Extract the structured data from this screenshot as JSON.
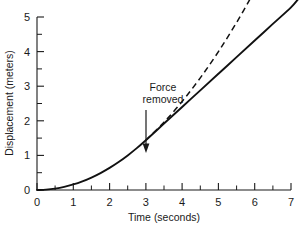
{
  "chart_data": {
    "type": "line",
    "title": "",
    "xlabel": "Time (seconds)",
    "ylabel": "Displacement (meters)",
    "xlim": [
      0,
      7
    ],
    "ylim": [
      0,
      5
    ],
    "xticks": [
      0,
      1,
      2,
      3,
      4,
      5,
      6,
      7
    ],
    "xtick_labels": [
      "0",
      "1",
      "2",
      "3",
      "4",
      "5",
      "6",
      "7"
    ],
    "yticks": [
      0,
      1,
      2,
      3,
      4,
      5
    ],
    "ytick_labels": [
      "0",
      "1",
      "2",
      "3",
      "4",
      "5"
    ],
    "x_minor_ticks": [
      0.5,
      1.5,
      2.5,
      3.5,
      4.5,
      5.5,
      6.5
    ],
    "y_minor_ticks": [
      0.5,
      1.5,
      2.5,
      3.5,
      4.5
    ],
    "grid": false,
    "legend": "none",
    "series": [
      {
        "name": "Displacement with force removed at t = 3 s",
        "style": "solid",
        "color": "#111111",
        "x": [
          0,
          0.25,
          0.5,
          0.75,
          1,
          1.25,
          1.5,
          1.75,
          2,
          2.25,
          2.5,
          2.75,
          3,
          3.5,
          4,
          4.5,
          5,
          5.5,
          6,
          6.5,
          7,
          7.2
        ],
        "y": [
          0,
          0.01,
          0.04,
          0.09,
          0.16,
          0.25,
          0.36,
          0.49,
          0.64,
          0.81,
          1.0,
          1.21,
          1.44,
          1.92,
          2.4,
          2.88,
          3.36,
          3.84,
          4.32,
          4.8,
          5.28,
          5.52
        ]
      },
      {
        "name": "Extrapolated parabola if force continued",
        "style": "dashed",
        "color": "#111111",
        "x": [
          3,
          3.5,
          4,
          4.5,
          5,
          5.5,
          6,
          6.2
        ],
        "y": [
          1.44,
          1.96,
          2.56,
          3.24,
          4.0,
          4.84,
          5.76,
          6.15
        ]
      }
    ],
    "annotations": [
      {
        "text_lines": [
          "Force",
          "removed"
        ],
        "text_x": 2.55,
        "text_y": 3.2,
        "arrow_from_x": 3.0,
        "arrow_from_y": 2.55,
        "arrow_to_x": 3.0,
        "arrow_to_y": 1.55
      }
    ]
  },
  "annotation": {
    "line1": "Force",
    "line2": "removed"
  },
  "axes": {
    "x_title": "Time (seconds)",
    "y_title": "Displacement (meters)",
    "x_labels": [
      "0",
      "1",
      "2",
      "3",
      "4",
      "5",
      "6",
      "7"
    ],
    "y_labels": [
      "0",
      "1",
      "2",
      "3",
      "4",
      "5"
    ]
  },
  "colors": {
    "ink": "#111111",
    "background": "#ffffff"
  }
}
